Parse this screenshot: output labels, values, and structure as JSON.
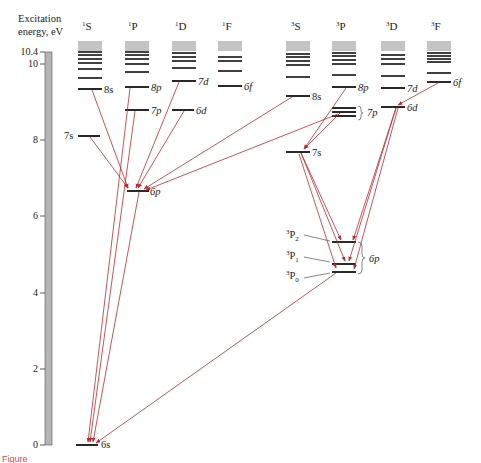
{
  "axis": {
    "label_line1": "Excitation",
    "label_line2": "energy, eV",
    "ticks": [
      {
        "label": "10.4",
        "value": 10.4
      },
      {
        "label": "10",
        "value": 10
      },
      {
        "label": "8",
        "value": 8
      },
      {
        "label": "6",
        "value": 6
      },
      {
        "label": "4",
        "value": 4
      },
      {
        "label": "2",
        "value": 2
      },
      {
        "label": "0",
        "value": 0
      }
    ]
  },
  "columns": [
    {
      "id": "1S",
      "sup": "1",
      "letter": "S",
      "x": 78,
      "named_levels": [
        {
          "label": "6s",
          "y": 445
        },
        {
          "label": "7s",
          "y": 136,
          "label_side": "left"
        },
        {
          "label": "8s",
          "y": 90
        }
      ],
      "upper_levels_y": [
        76,
        68,
        61,
        57,
        53,
        50
      ]
    },
    {
      "id": "1P",
      "sup": "1",
      "letter": "P",
      "x": 125,
      "named_levels": [
        {
          "label": "6p",
          "y": 191
        },
        {
          "label": "7p",
          "y": 110
        },
        {
          "label": "8p",
          "y": 87
        }
      ],
      "upper_levels_y": [
        72,
        63,
        57,
        53,
        50
      ]
    },
    {
      "id": "1D",
      "sup": "1",
      "letter": "D",
      "x": 172,
      "named_levels": [
        {
          "label": "6d",
          "y": 110
        },
        {
          "label": "7d",
          "y": 81
        }
      ],
      "upper_levels_y": [
        68,
        61,
        57,
        53
      ]
    },
    {
      "id": "1F",
      "sup": "1",
      "letter": "F",
      "x": 218,
      "named_levels": [
        {
          "label": "6f",
          "y": 86
        }
      ],
      "upper_levels_y": [
        71,
        62,
        58
      ]
    },
    {
      "id": "3S",
      "sup": "3",
      "letter": "S",
      "x": 286,
      "named_levels": [
        {
          "label": "7s",
          "y": 152
        },
        {
          "label": "8s",
          "y": 96
        }
      ],
      "upper_levels_y": [
        77,
        65,
        61,
        57,
        53
      ]
    },
    {
      "id": "3P",
      "sup": "3",
      "letter": "P",
      "x": 332,
      "named_levels": [
        {
          "label": "6p",
          "y": 264,
          "sublevels": [
            {
              "label": "3P2",
              "y": 243
            },
            {
              "label": "3P1",
              "y": 264
            },
            {
              "label": "3P0",
              "y": 272
            }
          ]
        },
        {
          "label": "7p",
          "y": 115,
          "sublevels_y": [
            111,
            115,
            119
          ]
        },
        {
          "label": "8p",
          "y": 87
        }
      ],
      "upper_levels_y": [
        75,
        64,
        60,
        56,
        52
      ]
    },
    {
      "id": "3D",
      "sup": "3",
      "letter": "D",
      "x": 381,
      "named_levels": [
        {
          "label": "6d",
          "y": 107
        },
        {
          "label": "7d",
          "y": 88
        }
      ],
      "upper_levels_y": [
        77,
        65,
        61,
        58,
        55,
        52
      ]
    },
    {
      "id": "3F",
      "sup": "3",
      "letter": "F",
      "x": 427,
      "named_levels": [
        {
          "label": "6f",
          "y": 83
        }
      ],
      "upper_levels_y": [
        74,
        64,
        61,
        58,
        55
      ]
    }
  ],
  "labels": {
    "s6": "6s",
    "s7": "7s",
    "s8": "8s",
    "p6": "6p",
    "p7": "7p",
    "p8": "8p",
    "d6": "6d",
    "d7": "7d",
    "f6": "6f",
    "t_s7": "7s",
    "t_s8": "8s",
    "t_p7": "7p",
    "t_p8": "8p",
    "t_d6": "6d",
    "t_d7": "7d",
    "t_f6": "6f",
    "t_p6": "6p",
    "P2": "P",
    "P2sub": "2",
    "P1": "P",
    "P1sub": "1",
    "P0": "P",
    "P0sub": "0",
    "sup3": "3",
    "sup1": "1",
    "S": "S",
    "P": "P",
    "D": "D",
    "F": "F"
  },
  "transitions": [
    {
      "from": "1S 8s",
      "to": "1P 6p"
    },
    {
      "from": "1S 7s",
      "to": "1P 6p"
    },
    {
      "from": "1D 7d",
      "to": "1P 6p"
    },
    {
      "from": "1D 6d",
      "to": "1P 6p"
    },
    {
      "from": "3S 8s",
      "to": "1P 6p"
    },
    {
      "from": "3P 7p",
      "to": "1P 6p"
    },
    {
      "from": "1P 8p",
      "to": "1S 6s"
    },
    {
      "from": "1P 7p",
      "to": "1S 6s"
    },
    {
      "from": "1P 6p",
      "to": "1S 6s"
    },
    {
      "from": "3P 6p (3P1)",
      "to": "1S 6s"
    },
    {
      "from": "3P 8p",
      "to": "3S 7s"
    },
    {
      "from": "3P 7p",
      "to": "3S 7s"
    },
    {
      "from": "3F 6f",
      "to": "3D 6d"
    },
    {
      "from": "3S 7s",
      "to": "3P 6p (3P2, 3P1, 3P0)"
    },
    {
      "from": "3D 6d",
      "to": "3P 6p (3P2, 3P1, 3P0)"
    }
  ],
  "colors": {
    "arrow": "#c0272d",
    "level": "#111111",
    "band": "#bdbdbd",
    "axis_bar": "#b5b5b5"
  },
  "caption": {
    "text": "Figure",
    "color": "#e3414a"
  }
}
